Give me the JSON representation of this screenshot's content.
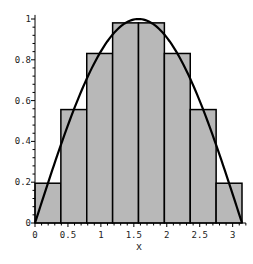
{
  "chart_data": {
    "type": "bar",
    "subtype": "riemann-sum-midpoint-with-curve",
    "title": "",
    "xlabel": "x",
    "ylabel": "",
    "xlim": [
      0,
      3.14159
    ],
    "ylim": [
      0,
      1
    ],
    "grid": false,
    "legend": null,
    "x_ticks": [
      0,
      0.5,
      1,
      1.5,
      2,
      2.5,
      3
    ],
    "x_tick_labels": [
      "0",
      "0.5",
      "1",
      "1.5",
      "2",
      "2.5",
      "3"
    ],
    "y_ticks": [
      0,
      0.2,
      0.4,
      0.6,
      0.8,
      1
    ],
    "y_tick_labels": [
      "0",
      "0.2",
      "0.4",
      "0.6",
      "0.8",
      "1"
    ],
    "bars": {
      "left_edges": [
        0,
        0.3927,
        0.7854,
        1.1781,
        1.5708,
        1.9635,
        2.3562,
        2.7489
      ],
      "width": 0.3927,
      "values": [
        0.195,
        0.556,
        0.831,
        0.981,
        0.981,
        0.831,
        0.556,
        0.195
      ],
      "fill": "#b8b8b8",
      "stroke": "#000000"
    },
    "curve": {
      "function": "sin(x)",
      "domain": [
        0,
        3.14159
      ],
      "color": "#000000"
    }
  }
}
